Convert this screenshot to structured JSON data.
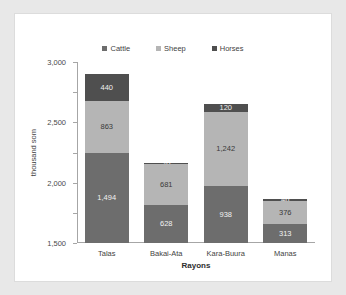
{
  "chart_data": {
    "type": "bar",
    "subtype": "stacked-bar",
    "title": "",
    "xlabel": "Rayons",
    "ylabel": "thousand som",
    "categories": [
      "Talas",
      "Bakai-Ata",
      "Kara-Buura",
      "Manas"
    ],
    "series": [
      {
        "name": "Cattle",
        "color": "#6d6d6d",
        "values": [
          1494,
          628,
          938,
          313
        ]
      },
      {
        "name": "Sheep",
        "color": "#b5b5b5",
        "values": [
          863,
          681,
          1242,
          376
        ]
      },
      {
        "name": "Horses",
        "color": "#4f4f4f",
        "values": [
          440,
          20,
          120,
          46
        ]
      }
    ],
    "stack_totals": [
      2797,
      1329,
      2300,
      735
    ],
    "ylim": [
      0,
      3000
    ],
    "ytick_labels": [
      "0",
      "500",
      "1,000",
      "1,500",
      "2,000",
      "2,500",
      "3,000"
    ],
    "ytick_values": [
      0,
      500,
      1000,
      1500,
      2000,
      2500,
      3000
    ],
    "grid": false,
    "legend_position": "top",
    "data_labels": {
      "Talas": {
        "Cattle": "1,494",
        "Sheep": "863",
        "Horses": "440"
      },
      "Bakai-Ata": {
        "Cattle": "628",
        "Sheep": "681",
        "Horses": "20"
      },
      "Kara-Buura": {
        "Cattle": "938",
        "Sheep": "1,242",
        "Horses": "120"
      },
      "Manas": {
        "Cattle": "313",
        "Sheep": "376",
        "Horses": "46"
      }
    }
  },
  "legend": {
    "items": [
      {
        "label": "Cattle",
        "color": "#6d6d6d"
      },
      {
        "label": "Sheep",
        "color": "#b5b5b5"
      },
      {
        "label": "Horses",
        "color": "#4f4f4f"
      }
    ]
  },
  "axes": {
    "y_title": "thousand som",
    "x_title": "Rayons"
  }
}
